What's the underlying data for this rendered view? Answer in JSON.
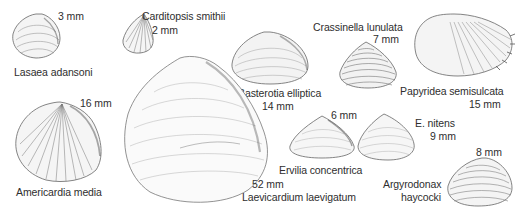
{
  "figure": {
    "type": "species illustration plate",
    "specimens": [
      {
        "name": "Lasaea adansoni",
        "size": "3 mm"
      },
      {
        "name": "Carditopsis smithii",
        "size": "2 mm"
      },
      {
        "name": "Basterotia elliptica",
        "size": "14 mm"
      },
      {
        "name": "Crassinella lunulata",
        "size": "7 mm"
      },
      {
        "name": "Papyridea semisulcata",
        "size": "15 mm"
      },
      {
        "name": "Americardia media",
        "size": "16 mm"
      },
      {
        "name": "Laevicardium laevigatum",
        "size": "52 mm"
      },
      {
        "name": "Ervilia concentrica",
        "size": "6 mm"
      },
      {
        "name": "E. nitens",
        "size": "9 mm"
      },
      {
        "name": "Argyrodonax haycocki",
        "name_line1": "Argyrodonax",
        "name_line2": "haycocki",
        "size": "8 mm"
      }
    ],
    "cut_off_heading": "▬▬ ▬▬▬▬▬▬▬▬▬"
  },
  "colors": {
    "ink": "#2e2e2e",
    "sketch": "#6a6a6a",
    "background": "#ffffff"
  }
}
